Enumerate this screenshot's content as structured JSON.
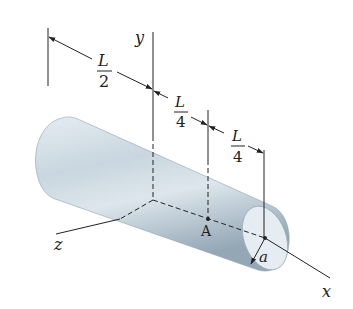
{
  "diagram": {
    "axes": {
      "x_label": "x",
      "y_label": "y",
      "z_label": "z"
    },
    "dimensions": [
      {
        "name": "half-length",
        "numerator": "L",
        "denominator": "2"
      },
      {
        "name": "quarter-length-1",
        "numerator": "L",
        "denominator": "4"
      },
      {
        "name": "quarter-length-2",
        "numerator": "L",
        "denominator": "4"
      }
    ],
    "point_label": "A",
    "radius_label": "a",
    "colors": {
      "cylinder_light": "#dfe8ee",
      "cylinder_mid": "#b9c9d4",
      "cylinder_dark": "#8fa3b1",
      "end_face": "#e6edf2",
      "line": "#222222"
    }
  }
}
